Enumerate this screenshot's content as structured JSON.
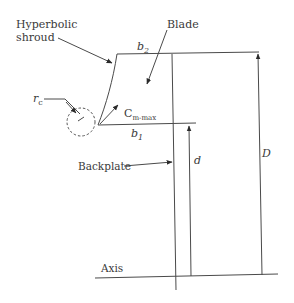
{
  "diagram": {
    "type": "centrifugal impeller meridional section",
    "labels": {
      "shroud_line1": "Hyperbolic",
      "shroud_line2": "shroud",
      "blade": "Blade",
      "b2": "b",
      "b2_sub": "2",
      "b1": "b",
      "b1_sub": "1",
      "rc": "r",
      "rc_sub": "c",
      "cm": "C",
      "cm_sub": "m-max",
      "backplate": "Backplate",
      "d": "d",
      "D": "D",
      "axis": "Axis"
    },
    "colors": {
      "line": "#4a4a4a",
      "text": "#3a3a3a",
      "background": "#ffffff"
    }
  }
}
